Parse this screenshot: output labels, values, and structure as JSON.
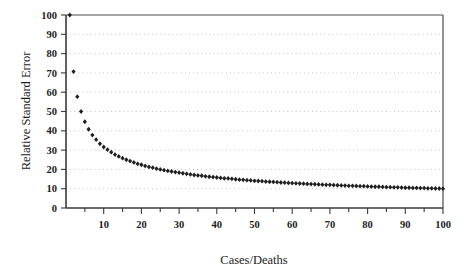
{
  "chart_data": {
    "type": "scatter",
    "title": "",
    "subtitle": "",
    "xlabel": "Cases/Deaths",
    "ylabel": "Relative Standard Error",
    "xlim": [
      0,
      100
    ],
    "ylim": [
      0,
      100
    ],
    "grid": "horizontal-dotted",
    "legend": "none",
    "formula": "y = 100 / sqrt(x)",
    "marker": "diamond",
    "marker_color": "#1f1f1f",
    "x_tick_labels": [
      "10",
      "20",
      "30",
      "40",
      "50",
      "60",
      "70",
      "80",
      "90",
      "100"
    ],
    "x_tick_values": [
      10,
      20,
      30,
      40,
      50,
      60,
      70,
      80,
      90,
      100
    ],
    "x_minor_tick_values": [
      5,
      15,
      25,
      35,
      45,
      55,
      65,
      75,
      85,
      95
    ],
    "y_tick_labels": [
      "0",
      "10",
      "20",
      "30",
      "40",
      "50",
      "60",
      "70",
      "80",
      "90",
      "100"
    ],
    "y_tick_values": [
      0,
      10,
      20,
      30,
      40,
      50,
      60,
      70,
      80,
      90,
      100
    ],
    "x": [
      1,
      2,
      3,
      4,
      5,
      6,
      7,
      8,
      9,
      10,
      11,
      12,
      13,
      14,
      15,
      16,
      17,
      18,
      19,
      20,
      21,
      22,
      23,
      24,
      25,
      26,
      27,
      28,
      29,
      30,
      31,
      32,
      33,
      34,
      35,
      36,
      37,
      38,
      39,
      40,
      41,
      42,
      43,
      44,
      45,
      46,
      47,
      48,
      49,
      50,
      51,
      52,
      53,
      54,
      55,
      56,
      57,
      58,
      59,
      60,
      61,
      62,
      63,
      64,
      65,
      66,
      67,
      68,
      69,
      70,
      71,
      72,
      73,
      74,
      75,
      76,
      77,
      78,
      79,
      80,
      81,
      82,
      83,
      84,
      85,
      86,
      87,
      88,
      89,
      90,
      91,
      92,
      93,
      94,
      95,
      96,
      97,
      98,
      99,
      100
    ],
    "y": [
      100.0,
      70.7,
      57.7,
      50.0,
      44.7,
      40.8,
      37.8,
      35.4,
      33.3,
      31.6,
      30.2,
      28.9,
      27.7,
      26.7,
      25.8,
      25.0,
      24.3,
      23.6,
      22.9,
      22.4,
      21.8,
      21.3,
      20.9,
      20.4,
      20.0,
      19.6,
      19.2,
      18.9,
      18.6,
      18.3,
      18.0,
      17.7,
      17.4,
      17.1,
      16.9,
      16.7,
      16.4,
      16.2,
      16.0,
      15.8,
      15.6,
      15.4,
      15.3,
      15.1,
      14.9,
      14.7,
      14.6,
      14.4,
      14.3,
      14.1,
      14.0,
      13.9,
      13.7,
      13.6,
      13.5,
      13.4,
      13.2,
      13.1,
      13.0,
      12.9,
      12.8,
      12.7,
      12.6,
      12.5,
      12.4,
      12.3,
      12.2,
      12.1,
      12.0,
      12.0,
      11.9,
      11.8,
      11.7,
      11.6,
      11.5,
      11.5,
      11.4,
      11.3,
      11.3,
      11.2,
      11.1,
      11.0,
      11.0,
      10.9,
      10.8,
      10.8,
      10.7,
      10.7,
      10.6,
      10.5,
      10.5,
      10.4,
      10.4,
      10.3,
      10.3,
      10.2,
      10.2,
      10.1,
      10.1,
      10.0
    ]
  },
  "axes": {
    "x_title": "Cases/Deaths",
    "y_title": "Relative Standard Error"
  }
}
